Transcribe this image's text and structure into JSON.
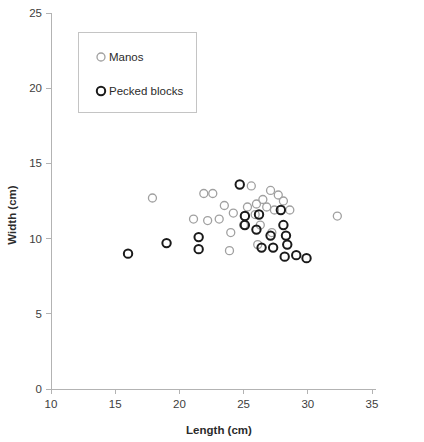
{
  "chart_data": {
    "type": "scatter",
    "title": "",
    "xlabel": "Length (cm)",
    "ylabel": "Width (cm)",
    "xlim": [
      10,
      35
    ],
    "ylim": [
      0,
      25
    ],
    "xticks": [
      10,
      15,
      20,
      25,
      30,
      35
    ],
    "yticks": [
      0,
      5,
      10,
      15,
      20,
      25
    ],
    "grid": false,
    "legend_position": "upper-left",
    "series": [
      {
        "name": "Manos",
        "marker": "open-circle",
        "color": "#a0a0a0",
        "points": [
          [
            17.9,
            12.7
          ],
          [
            21.9,
            13.0
          ],
          [
            22.6,
            13.0
          ],
          [
            23.5,
            12.2
          ],
          [
            23.1,
            11.3
          ],
          [
            22.2,
            11.2
          ],
          [
            21.1,
            11.3
          ],
          [
            24.2,
            11.7
          ],
          [
            24.0,
            10.4
          ],
          [
            23.9,
            9.2
          ],
          [
            25.3,
            12.1
          ],
          [
            25.6,
            13.5
          ],
          [
            25.1,
            11.5
          ],
          [
            25.0,
            10.9
          ],
          [
            25.9,
            11.6
          ],
          [
            26.5,
            12.6
          ],
          [
            26.0,
            12.3
          ],
          [
            26.8,
            12.1
          ],
          [
            26.3,
            10.9
          ],
          [
            27.1,
            13.2
          ],
          [
            27.7,
            12.9
          ],
          [
            27.4,
            11.9
          ],
          [
            28.1,
            12.5
          ],
          [
            28.6,
            11.9
          ],
          [
            27.2,
            10.4
          ],
          [
            26.1,
            9.6
          ],
          [
            32.3,
            11.5
          ]
        ]
      },
      {
        "name": "Pecked blocks",
        "marker": "open-circle-bold",
        "color": "#1a1a1a",
        "points": [
          [
            16.0,
            9.0
          ],
          [
            19.0,
            9.7
          ],
          [
            21.5,
            10.1
          ],
          [
            21.5,
            9.3
          ],
          [
            24.7,
            13.6
          ],
          [
            25.1,
            11.5
          ],
          [
            25.1,
            10.9
          ],
          [
            26.2,
            11.6
          ],
          [
            26.0,
            10.6
          ],
          [
            27.9,
            11.9
          ],
          [
            28.1,
            10.9
          ],
          [
            27.1,
            10.2
          ],
          [
            28.3,
            10.2
          ],
          [
            26.4,
            9.4
          ],
          [
            27.3,
            9.4
          ],
          [
            28.4,
            9.6
          ],
          [
            28.2,
            8.8
          ],
          [
            29.1,
            8.9
          ],
          [
            29.9,
            8.7
          ]
        ]
      }
    ]
  },
  "legend": {
    "entries": [
      {
        "label": "Manos"
      },
      {
        "label": "Pecked blocks"
      }
    ]
  }
}
